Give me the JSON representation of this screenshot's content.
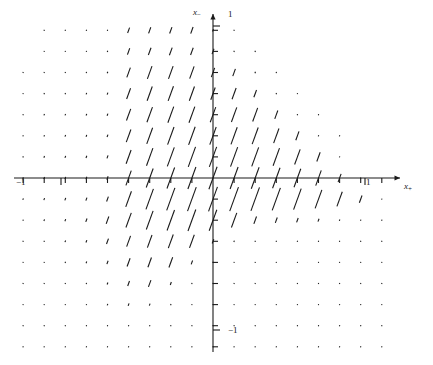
{
  "figure": {
    "title": "",
    "background_color": "#ffffff",
    "ink_color": "#1a1a1a",
    "width": 433,
    "height": 365
  },
  "axes": {
    "x_axis": {
      "label": "x",
      "label_subscript": "+",
      "label_full": "x₊",
      "arrow": true,
      "pixel_y": 178,
      "pixel_x_start": 14,
      "pixel_x_end": 400,
      "origin_px": 213,
      "unit_px": 152,
      "tick_spacing_px": 21.1,
      "tick_length_px": 5,
      "tick_direction": "down",
      "tick_labels": [
        {
          "text": "−1",
          "value": -1,
          "pixel_x": 22
        },
        {
          "text": "1",
          "value": 1,
          "pixel_x": 369
        }
      ]
    },
    "y_axis": {
      "label": "x",
      "label_subscript": "−",
      "label_full": "x₋",
      "arrow": true,
      "pixel_x": 213,
      "pixel_y_start": 14,
      "pixel_y_end": 352,
      "origin_py": 178,
      "unit_px": 152,
      "tick_spacing_px": 21.1,
      "tick_length_px": 5,
      "tick_direction": "right",
      "tick_labels": [
        {
          "text": "1",
          "value": 1,
          "pixel_y": 16
        },
        {
          "text": "−1",
          "value": -1,
          "pixel_y": 331
        }
      ]
    },
    "grid": false,
    "frame": false
  },
  "chart_data": {
    "type": "scatter",
    "subtype": "vector-field",
    "title": "",
    "xlabel": "x₊",
    "ylabel": "x₋",
    "xlim": [
      -1.31,
      1.23
    ],
    "ylim": [
      -1.08,
      1.08
    ],
    "grid": false,
    "legend": null,
    "glyph": {
      "kind": "line-segment",
      "angle_deg_from_vertical": 20,
      "orientation_note": "all segments tilt clockwise from vertical by about 20 degrees, leaning right at top",
      "min_length_px": 1,
      "max_length_px": 26,
      "color": "#1a1a1a",
      "line_width_px": 1.1
    },
    "sampling": {
      "x_step": 0.1388,
      "y_step": 0.1388,
      "x_indices": [
        -9,
        -8,
        -7,
        -6,
        -5,
        -4,
        -3,
        -2,
        -1,
        0,
        1,
        2,
        3,
        4,
        5,
        6,
        7,
        8
      ],
      "y_indices": [
        -8,
        -7,
        -6,
        -5,
        -4,
        -3,
        -2,
        -1,
        0,
        1,
        2,
        3,
        4,
        5,
        6,
        7
      ]
    },
    "magnitude_grid": {
      "note": "rows top to bottom correspond to y index 7 down to -8; columns left to right to x index -9 to 8; values are relative segment lengths 0..1",
      "y_index_top": 7,
      "x_index_left": -9,
      "rows": [
        [
          0.0,
          0.02,
          0.03,
          0.03,
          0.04,
          0.22,
          0.25,
          0.26,
          0.27,
          0.1,
          0.04,
          0.0,
          0.0,
          0.0,
          0.0,
          0.0,
          0.0,
          0.0
        ],
        [
          0.0,
          0.03,
          0.04,
          0.04,
          0.05,
          0.26,
          0.3,
          0.31,
          0.3,
          0.22,
          0.05,
          0.05,
          0.0,
          0.0,
          0.0,
          0.0,
          0.0,
          0.0
        ],
        [
          0.03,
          0.04,
          0.04,
          0.05,
          0.06,
          0.4,
          0.52,
          0.52,
          0.5,
          0.38,
          0.3,
          0.06,
          0.05,
          0.0,
          0.0,
          0.0,
          0.0,
          0.0
        ],
        [
          0.04,
          0.05,
          0.05,
          0.06,
          0.08,
          0.44,
          0.58,
          0.6,
          0.58,
          0.5,
          0.46,
          0.3,
          0.05,
          0.04,
          0.0,
          0.0,
          0.0,
          0.0
        ],
        [
          0.05,
          0.06,
          0.06,
          0.07,
          0.09,
          0.48,
          0.62,
          0.66,
          0.66,
          0.62,
          0.6,
          0.56,
          0.34,
          0.05,
          0.04,
          0.0,
          0.0,
          0.0
        ],
        [
          0.05,
          0.06,
          0.07,
          0.08,
          0.1,
          0.52,
          0.66,
          0.72,
          0.74,
          0.72,
          0.7,
          0.68,
          0.6,
          0.36,
          0.05,
          0.03,
          0.0,
          0.0
        ],
        [
          0.05,
          0.07,
          0.08,
          0.09,
          0.12,
          0.56,
          0.72,
          0.78,
          0.82,
          0.82,
          0.8,
          0.78,
          0.72,
          0.62,
          0.38,
          0.04,
          0.0,
          0.0
        ],
        [
          0.06,
          0.08,
          0.09,
          0.1,
          0.14,
          0.6,
          0.78,
          0.86,
          0.9,
          0.92,
          0.9,
          0.88,
          0.84,
          0.76,
          0.62,
          0.34,
          0.04,
          0.0
        ],
        [
          0.06,
          0.08,
          0.1,
          0.12,
          0.2,
          0.64,
          0.84,
          0.92,
          0.98,
          1.0,
          0.98,
          0.96,
          0.92,
          0.86,
          0.76,
          0.6,
          0.3,
          0.03
        ],
        [
          0.05,
          0.07,
          0.09,
          0.14,
          0.3,
          0.6,
          0.76,
          0.84,
          0.88,
          0.86,
          0.6,
          0.3,
          0.22,
          0.18,
          0.12,
          0.06,
          0.04,
          0.02
        ],
        [
          0.04,
          0.05,
          0.07,
          0.1,
          0.22,
          0.44,
          0.52,
          0.56,
          0.54,
          0.18,
          0.06,
          0.05,
          0.04,
          0.04,
          0.03,
          0.03,
          0.02,
          0.02
        ],
        [
          0.03,
          0.04,
          0.05,
          0.07,
          0.14,
          0.34,
          0.4,
          0.42,
          0.16,
          0.05,
          0.04,
          0.04,
          0.03,
          0.03,
          0.03,
          0.02,
          0.02,
          0.02
        ],
        [
          0.02,
          0.03,
          0.04,
          0.05,
          0.08,
          0.2,
          0.28,
          0.12,
          0.05,
          0.04,
          0.03,
          0.03,
          0.03,
          0.02,
          0.02,
          0.02,
          0.02,
          0.02
        ],
        [
          0.02,
          0.02,
          0.03,
          0.04,
          0.06,
          0.1,
          0.08,
          0.05,
          0.04,
          0.03,
          0.03,
          0.02,
          0.02,
          0.02,
          0.02,
          0.02,
          0.02,
          0.02
        ],
        [
          0.01,
          0.02,
          0.02,
          0.03,
          0.04,
          0.05,
          0.05,
          0.04,
          0.03,
          0.03,
          0.02,
          0.02,
          0.02,
          0.02,
          0.02,
          0.02,
          0.02,
          0.01
        ],
        [
          0.01,
          0.01,
          0.02,
          0.02,
          0.03,
          0.04,
          0.04,
          0.03,
          0.03,
          0.02,
          0.02,
          0.02,
          0.02,
          0.02,
          0.01,
          0.01,
          0.01,
          0.01
        ]
      ]
    }
  }
}
